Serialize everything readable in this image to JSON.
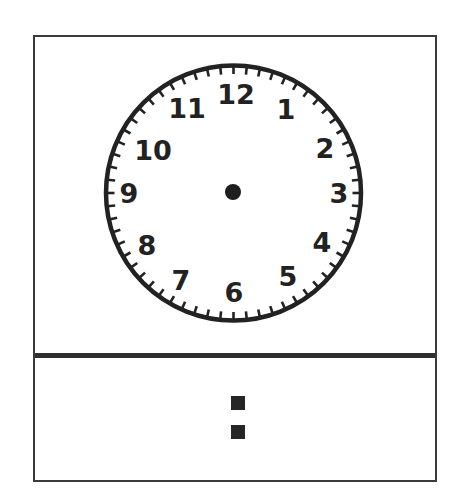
{
  "worksheet": {
    "clock": {
      "numerals": [
        "12",
        "1",
        "2",
        "3",
        "4",
        "5",
        "6",
        "7",
        "8",
        "9",
        "10",
        "11"
      ],
      "tick_count": 60,
      "hands": "none"
    },
    "digital_time": {
      "hours": "",
      "separator": ":",
      "minutes": ""
    }
  },
  "colors": {
    "ink": "#222222",
    "background": "#ffffff"
  }
}
